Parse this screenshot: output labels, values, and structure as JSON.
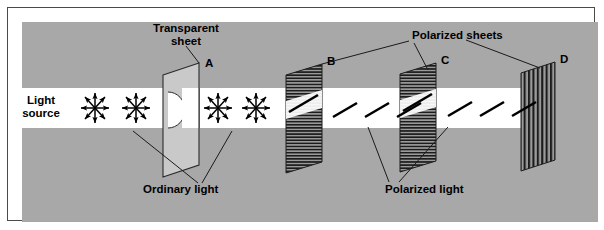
{
  "figure": {
    "background_color": "#a8a8a8",
    "beam_color": "#ffffff",
    "frame_color": "#4a4a4a",
    "sheet_fill": "#9a9a9a",
    "transparent_sheet_fill": "#c9c9c9",
    "ink_color": "#000000"
  },
  "labels": {
    "light_source": "Light\nsource",
    "light_source_line1": "Light",
    "light_source_line2": "source",
    "transparent_sheet": "Transparent\nsheet",
    "transparent_sheet_line1": "Transparent",
    "transparent_sheet_line2": "sheet",
    "ordinary_light": "Ordinary light",
    "polarized_sheets": "Polarized sheets",
    "polarized_light": "Polarized light"
  },
  "elements": [
    {
      "id": "A",
      "label": "A",
      "kind": "transparent-sheet",
      "ruling": "none",
      "x": 205,
      "y": 57,
      "note": "Transparent sheet with circular aperture"
    },
    {
      "id": "B",
      "label": "B",
      "kind": "polarizing-sheet",
      "ruling": "horizontal",
      "x": 327,
      "y": 55,
      "note": "First polarizer, horizontal rulings"
    },
    {
      "id": "C",
      "label": "C",
      "kind": "polarizing-sheet",
      "ruling": "horizontal",
      "x": 441,
      "y": 54,
      "note": "Second polarizer, horizontal rulings"
    },
    {
      "id": "D",
      "label": "D",
      "kind": "polarizing-sheet",
      "ruling": "vertical",
      "x": 560,
      "y": 53,
      "note": "Crossed polarizer, vertical rulings, blocks beam"
    }
  ],
  "light_states": {
    "unpolarized": {
      "name": "Ordinary light",
      "glyph": "eight-direction-starburst-arrows",
      "positions_x": [
        95,
        135,
        218,
        255
      ]
    },
    "polarized": {
      "name": "Polarized light",
      "glyph": "diagonal-double-headed-arrow",
      "segments": [
        "between B and C",
        "between C and D"
      ]
    },
    "extinguished": {
      "name": "No light past D",
      "after": "D"
    }
  },
  "leaders": {
    "transparent_sheet_to": [
      "A"
    ],
    "ordinary_light_to": [
      "beam-before-A",
      "beam-after-A"
    ],
    "polarized_sheets_to": [
      "B",
      "C",
      "D"
    ],
    "polarized_light_to": [
      "beam-B-to-C",
      "beam-C-to-D"
    ]
  }
}
